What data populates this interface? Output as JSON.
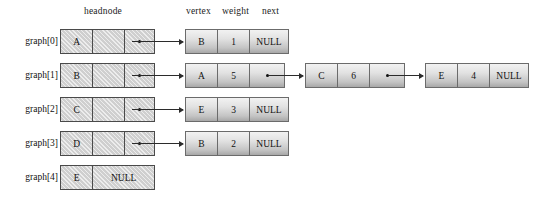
{
  "diagram": {
    "headers": {
      "headnode": "headnode",
      "vertex": "vertex",
      "weight": "weight",
      "next": "next"
    },
    "null_text": "NULL",
    "colors": {
      "headnode_fill": "#cfcfcf",
      "headnode_border": "#4a4a4a",
      "node_border": "#6b6b6b",
      "node_gradient_top": "#f2f2f2",
      "node_gradient_bottom": "#a8a8a8",
      "arrow": "#2b2b2b",
      "text": "#111111",
      "background": "#ffffff"
    },
    "rows": [
      {
        "label": "graph[0]",
        "headnode": {
          "vertex": "A",
          "next_is_null": false
        },
        "nodes": [
          {
            "vertex": "B",
            "weight": "1",
            "next": "NULL",
            "next_is_null": true
          }
        ]
      },
      {
        "label": "graph[1]",
        "headnode": {
          "vertex": "B",
          "next_is_null": false
        },
        "nodes": [
          {
            "vertex": "A",
            "weight": "5",
            "next": "",
            "next_is_null": false
          },
          {
            "vertex": "C",
            "weight": "6",
            "next": "",
            "next_is_null": false
          },
          {
            "vertex": "E",
            "weight": "4",
            "next": "NULL",
            "next_is_null": true
          }
        ]
      },
      {
        "label": "graph[2]",
        "headnode": {
          "vertex": "C",
          "next_is_null": false
        },
        "nodes": [
          {
            "vertex": "E",
            "weight": "3",
            "next": "NULL",
            "next_is_null": true
          }
        ]
      },
      {
        "label": "graph[3]",
        "headnode": {
          "vertex": "D",
          "next_is_null": false
        },
        "nodes": [
          {
            "vertex": "B",
            "weight": "2",
            "next": "NULL",
            "next_is_null": true
          }
        ]
      },
      {
        "label": "graph[4]",
        "headnode": {
          "vertex": "E",
          "next_is_null": true
        },
        "nodes": []
      }
    ]
  }
}
